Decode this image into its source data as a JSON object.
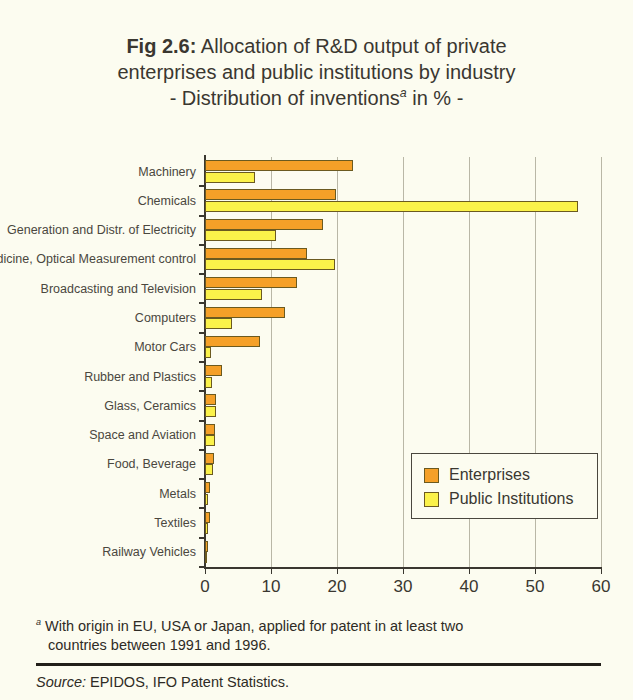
{
  "title": {
    "fig_number": "Fig 2.6:",
    "line1_rest": " Allocation of R&D output of private",
    "line2": "enterprises and public institutions by industry",
    "line3_pre": "- Distribution of inventions",
    "line3_sup": "a",
    "line3_post": " in % -"
  },
  "legend": {
    "enterprises_label": "Enterprises",
    "public_label": "Public Institutions"
  },
  "footnote": {
    "marker": "a",
    "line1": " With origin in EU, USA or Japan, applied for patent in at least two",
    "line2": "countries between 1991 and 1996."
  },
  "source": {
    "word": "Source:",
    "text": " EPIDOS, IFO Patent Statistics."
  },
  "colors": {
    "enterprises": "#f5a028",
    "public_institutions": "#fbf24a",
    "background": "#fcfcf0",
    "axis": "#3a3730",
    "gridline": "#b9b7a6",
    "bar_border": "#6b5a20"
  },
  "chart_data": {
    "type": "bar",
    "orientation": "horizontal",
    "xlabel": "",
    "ylabel": "",
    "xlim": [
      0,
      60
    ],
    "xticks": [
      0,
      10,
      20,
      30,
      40,
      50,
      60
    ],
    "xtick_labels": [
      "0",
      "10",
      "20",
      "30",
      "40",
      "50",
      "60"
    ],
    "grid": true,
    "grid_axis": "x",
    "legend_position": "center-right",
    "categories": [
      "Machinery",
      "Chemicals",
      "Generation and Distr. of Electricity",
      "Medicine, Optical Measurement control",
      "Broadcasting and Television",
      "Computers",
      "Motor Cars",
      "Rubber and Plastics",
      "Glass, Ceramics",
      "Space and Aviation",
      "Food, Beverage",
      "Metals",
      "Textiles",
      "Railway Vehicles"
    ],
    "series": [
      {
        "name": "Enterprises",
        "color": "#f5a028",
        "values": [
          22.4,
          19.8,
          17.9,
          15.5,
          14.0,
          12.1,
          8.3,
          2.5,
          1.7,
          1.5,
          1.3,
          0.8,
          0.8,
          0.5
        ]
      },
      {
        "name": "Public Institutions",
        "color": "#fbf24a",
        "values": [
          7.5,
          56.5,
          10.8,
          19.7,
          8.7,
          4.1,
          0.9,
          1.0,
          1.7,
          1.5,
          1.2,
          0.4,
          0.4,
          0.3
        ]
      }
    ]
  }
}
